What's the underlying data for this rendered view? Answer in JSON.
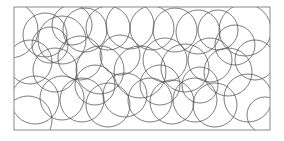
{
  "figure": {
    "frame": {
      "x": 14,
      "y": 7,
      "width": 256,
      "height": 123,
      "stroke": "#8a8a8a"
    },
    "circle_stroke": "#4a4a4a",
    "circles": [
      {
        "cx": 10,
        "cy": 30,
        "r": 28
      },
      {
        "cx": 45,
        "cy": 35,
        "r": 22
      },
      {
        "cx": 62,
        "cy": 40,
        "r": 24
      },
      {
        "cx": 85,
        "cy": 30,
        "r": 22
      },
      {
        "cx": 72,
        "cy": 25,
        "r": 20
      },
      {
        "cx": 108,
        "cy": 28,
        "r": 22
      },
      {
        "cx": 130,
        "cy": 25,
        "r": 24
      },
      {
        "cx": 152,
        "cy": 28,
        "r": 22
      },
      {
        "cx": 175,
        "cy": 30,
        "r": 22
      },
      {
        "cx": 198,
        "cy": 32,
        "r": 22
      },
      {
        "cx": 218,
        "cy": 30,
        "r": 20
      },
      {
        "cx": 245,
        "cy": 30,
        "r": 26
      },
      {
        "cx": 30,
        "cy": 62,
        "r": 22
      },
      {
        "cx": 55,
        "cy": 70,
        "r": 22
      },
      {
        "cx": 80,
        "cy": 58,
        "r": 22
      },
      {
        "cx": 100,
        "cy": 70,
        "r": 24
      },
      {
        "cx": 140,
        "cy": 72,
        "r": 26
      },
      {
        "cx": 165,
        "cy": 60,
        "r": 22
      },
      {
        "cx": 185,
        "cy": 68,
        "r": 24
      },
      {
        "cx": 210,
        "cy": 60,
        "r": 22
      },
      {
        "cx": 228,
        "cy": 72,
        "r": 24
      },
      {
        "cx": 255,
        "cy": 60,
        "r": 20
      },
      {
        "cx": 35,
        "cy": 100,
        "r": 24
      },
      {
        "cx": 28,
        "cy": 120,
        "r": 24
      },
      {
        "cx": 62,
        "cy": 98,
        "r": 22
      },
      {
        "cx": 82,
        "cy": 100,
        "r": 22
      },
      {
        "cx": 108,
        "cy": 105,
        "r": 22
      },
      {
        "cx": 125,
        "cy": 95,
        "r": 22
      },
      {
        "cx": 150,
        "cy": 100,
        "r": 22
      },
      {
        "cx": 172,
        "cy": 102,
        "r": 22
      },
      {
        "cx": 195,
        "cy": 100,
        "r": 22
      },
      {
        "cx": 215,
        "cy": 105,
        "r": 22
      },
      {
        "cx": 248,
        "cy": 98,
        "r": 24
      },
      {
        "cx": 120,
        "cy": 55,
        "r": 20
      },
      {
        "cx": 50,
        "cy": 45,
        "r": 18
      },
      {
        "cx": 95,
        "cy": 85,
        "r": 20
      },
      {
        "cx": 160,
        "cy": 85,
        "r": 20
      },
      {
        "cx": 235,
        "cy": 45,
        "r": 20
      },
      {
        "cx": 200,
        "cy": 85,
        "r": 18
      },
      {
        "cx": 265,
        "cy": 115,
        "r": 18
      }
    ]
  }
}
